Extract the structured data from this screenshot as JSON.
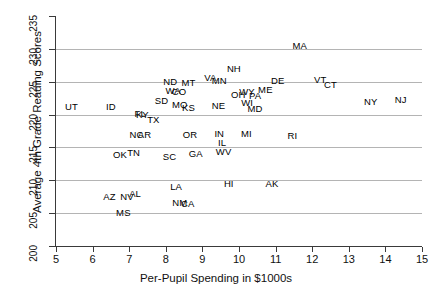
{
  "chart_data": {
    "type": "scatter",
    "title": "",
    "xlabel": "Per-Pupil Spending in $1000s",
    "ylabel": "Average 4th Grade Reading Scores",
    "xlim": [
      5,
      15
    ],
    "ylim": [
      200,
      235
    ],
    "xticks": [
      5,
      6,
      7,
      8,
      9,
      10,
      11,
      12,
      13,
      14,
      15
    ],
    "yticks": [
      200,
      205,
      210,
      215,
      220,
      225,
      230,
      235
    ],
    "gridlines": {
      "y": [
        205,
        210,
        215,
        220,
        225,
        230
      ],
      "x": []
    },
    "grid": true,
    "legend": "none",
    "marker": "text-label",
    "points": [
      {
        "label": "UT",
        "x": 5.42,
        "y": 221.1
      },
      {
        "label": "ID",
        "x": 6.5,
        "y": 221.1
      },
      {
        "label": "AZ",
        "x": 6.46,
        "y": 207.5
      },
      {
        "label": "NV",
        "x": 6.94,
        "y": 207.5
      },
      {
        "label": "AL",
        "x": 7.16,
        "y": 207.9
      },
      {
        "label": "MS",
        "x": 6.84,
        "y": 205.0
      },
      {
        "label": "OK",
        "x": 6.75,
        "y": 213.8
      },
      {
        "label": "TN",
        "x": 7.12,
        "y": 214.1
      },
      {
        "label": "NC",
        "x": 7.2,
        "y": 216.9
      },
      {
        "label": "AR",
        "x": 7.42,
        "y": 216.9
      },
      {
        "label": "KY",
        "x": 7.36,
        "y": 219.9
      },
      {
        "label": "FL",
        "x": 7.3,
        "y": 220.1
      },
      {
        "label": "TX",
        "x": 7.66,
        "y": 219.2
      },
      {
        "label": "SD",
        "x": 7.88,
        "y": 222.1
      },
      {
        "label": "ND",
        "x": 8.12,
        "y": 224.9
      },
      {
        "label": "WA",
        "x": 8.2,
        "y": 223.6
      },
      {
        "label": "CO",
        "x": 8.36,
        "y": 223.5
      },
      {
        "label": "MT",
        "x": 8.62,
        "y": 224.8
      },
      {
        "label": "MO",
        "x": 8.38,
        "y": 221.4
      },
      {
        "label": "KS",
        "x": 8.62,
        "y": 221.0
      },
      {
        "label": "SC",
        "x": 8.1,
        "y": 213.6
      },
      {
        "label": "LA",
        "x": 8.28,
        "y": 209.0
      },
      {
        "label": "NM",
        "x": 8.38,
        "y": 206.5
      },
      {
        "label": "CA",
        "x": 8.6,
        "y": 206.4
      },
      {
        "label": "GA",
        "x": 8.82,
        "y": 214.0
      },
      {
        "label": "OR",
        "x": 8.66,
        "y": 216.9
      },
      {
        "label": "VA",
        "x": 9.22,
        "y": 225.6
      },
      {
        "label": "MN",
        "x": 9.46,
        "y": 225.1
      },
      {
        "label": "NE",
        "x": 9.44,
        "y": 221.3
      },
      {
        "label": "IN",
        "x": 9.46,
        "y": 217.0
      },
      {
        "label": "IL",
        "x": 9.54,
        "y": 215.6
      },
      {
        "label": "WV",
        "x": 9.58,
        "y": 214.3
      },
      {
        "label": "HI",
        "x": 9.72,
        "y": 209.4
      },
      {
        "label": "NH",
        "x": 9.86,
        "y": 226.9
      },
      {
        "label": "OH",
        "x": 9.98,
        "y": 223.0
      },
      {
        "label": "WY",
        "x": 10.22,
        "y": 223.4
      },
      {
        "label": "PA",
        "x": 10.44,
        "y": 222.9
      },
      {
        "label": "WI",
        "x": 10.22,
        "y": 221.8
      },
      {
        "label": "MD",
        "x": 10.44,
        "y": 220.8
      },
      {
        "label": "MI",
        "x": 10.2,
        "y": 217.1
      },
      {
        "label": "ME",
        "x": 10.72,
        "y": 223.8
      },
      {
        "label": "DE",
        "x": 11.06,
        "y": 225.1
      },
      {
        "label": "AK",
        "x": 10.9,
        "y": 209.4
      },
      {
        "label": "RI",
        "x": 11.46,
        "y": 216.7
      },
      {
        "label": "MA",
        "x": 11.66,
        "y": 230.4
      },
      {
        "label": "VT",
        "x": 12.22,
        "y": 225.2
      },
      {
        "label": "CT",
        "x": 12.5,
        "y": 224.5
      },
      {
        "label": "NY",
        "x": 13.6,
        "y": 221.9
      },
      {
        "label": "NJ",
        "x": 14.42,
        "y": 222.2
      }
    ]
  }
}
